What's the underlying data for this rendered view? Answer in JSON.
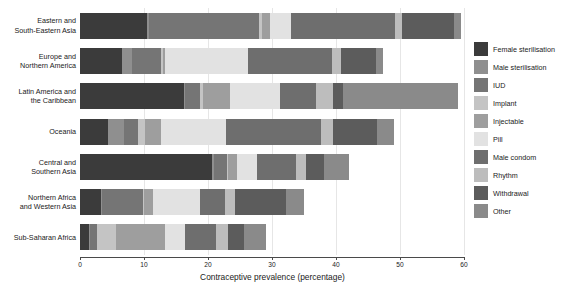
{
  "chart_data": {
    "type": "bar",
    "orientation": "horizontal",
    "stacked": true,
    "title": "",
    "xlabel": "Contraceptive prevalence (percentage)",
    "ylabel": "",
    "xlim": [
      0,
      60
    ],
    "xticks": [
      0,
      10,
      20,
      30,
      40,
      50,
      60
    ],
    "xticklabels": [
      "0",
      "10",
      "20",
      "30",
      "40",
      "50",
      "60"
    ],
    "grid": true,
    "legend_position": "right",
    "categories": [
      "Eastern and\nSouth-Eastern Asia",
      "Europe and\nNorthern America",
      "Latin America and\nthe Caribbean",
      "Oceania",
      "Central and\nSouthern Asia",
      "Northern Africa\nand Western Asia",
      "Sub-Saharan Africa"
    ],
    "category_labels": [
      [
        "Eastern and",
        "South-Eastern Asia"
      ],
      [
        "Europe and",
        "Northern America"
      ],
      [
        "Latin America and",
        "the Caribbean"
      ],
      [
        "Oceania"
      ],
      [
        "Central and",
        "Southern Asia"
      ],
      [
        "Northern Africa",
        "and Western Asia"
      ],
      [
        "Sub-Saharan Africa"
      ]
    ],
    "series": [
      {
        "name": "Female sterilisation",
        "color": "#3b3b3b",
        "values": [
          10.4,
          6.6,
          16.2,
          4.3,
          20.6,
          3.3,
          1.4
        ]
      },
      {
        "name": "Male sterilisation",
        "color": "#8f8f8f",
        "values": [
          0.4,
          1.6,
          0.2,
          2.6,
          0.3,
          0.1,
          0.1
        ]
      },
      {
        "name": "IUD",
        "color": "#757575",
        "values": [
          17.2,
          4.4,
          2.4,
          2.1,
          2.0,
          6.4,
          1.2
        ]
      },
      {
        "name": "Implant",
        "color": "#c4c4c4",
        "values": [
          0.5,
          0.3,
          0.5,
          1.1,
          0.3,
          0.2,
          3.0
        ]
      },
      {
        "name": "Injectable",
        "color": "#9e9e9e",
        "values": [
          1.2,
          0.4,
          4.2,
          2.5,
          1.4,
          1.4,
          7.6
        ]
      },
      {
        "name": "Pill",
        "color": "#e2e2e2",
        "values": [
          3.2,
          13.0,
          7.8,
          10.2,
          3.0,
          7.4,
          3.1
        ]
      },
      {
        "name": "Male condom",
        "color": "#6e6e6e",
        "values": [
          16.4,
          13.1,
          5.6,
          14.8,
          6.1,
          3.8,
          4.8
        ]
      },
      {
        "name": "Rhythm",
        "color": "#bdbdbd",
        "values": [
          1.0,
          1.4,
          2.6,
          2.0,
          1.6,
          1.7,
          2.0
        ]
      },
      {
        "name": "Withdrawal",
        "color": "#5c5c5c",
        "values": [
          8.2,
          5.4,
          1.6,
          6.8,
          2.8,
          7.9,
          2.4
        ]
      },
      {
        "name": "Other",
        "color": "#8a8a8a",
        "values": [
          1.1,
          1.2,
          17.9,
          2.6,
          3.9,
          2.8,
          3.4
        ]
      }
    ],
    "totals": [
      59.6,
      47.4,
      59.0,
      49.0,
      42.0,
      35.0,
      29.0
    ]
  },
  "legend": {
    "items": [
      {
        "label": "Female sterilisation",
        "color": "#3b3b3b"
      },
      {
        "label": "Male sterilisation",
        "color": "#8f8f8f"
      },
      {
        "label": "IUD",
        "color": "#757575"
      },
      {
        "label": "Implant",
        "color": "#c4c4c4"
      },
      {
        "label": "Injectable",
        "color": "#9e9e9e"
      },
      {
        "label": "Pill",
        "color": "#e2e2e2"
      },
      {
        "label": "Male condom",
        "color": "#6e6e6e"
      },
      {
        "label": "Rhythm",
        "color": "#bdbdbd"
      },
      {
        "label": "Withdrawal",
        "color": "#5c5c5c"
      },
      {
        "label": "Other",
        "color": "#8a8a8a"
      }
    ]
  },
  "colors": {
    "background": "#ffffff",
    "axis": "#4a4a4a",
    "grid": "#e6e6e6",
    "text": "#1a1a1a"
  }
}
